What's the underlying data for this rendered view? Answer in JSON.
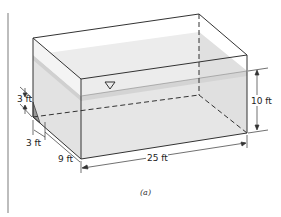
{
  "figure": {
    "caption": "(a)",
    "labels": {
      "depth": "10 ft",
      "length": "25 ft",
      "width": "9 ft",
      "slope_height": "3 ft",
      "slope_run": "3 ft"
    },
    "symbols": {
      "free_surface": "water-surface-triangle"
    },
    "colors": {
      "water": "#e6e6e6",
      "water_surface_band": "#cfcfcf",
      "edges": "#333333",
      "slope_fill": "#9a9a9a",
      "margin_bar": "#bdbdbd"
    }
  }
}
